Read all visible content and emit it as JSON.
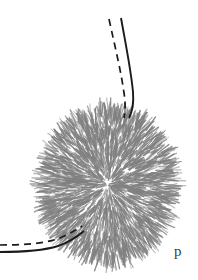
{
  "figure": {
    "type": "scientific-line-drawing",
    "background_color": "#ffffff",
    "ink_color": "#1a1a1a",
    "hair_color": "#808080",
    "panel_label": "p",
    "elements": {
      "spiny_ball": {
        "name": "spiny-ball",
        "center_x": 108,
        "center_y": 185,
        "radius_x": 61,
        "radius_y": 71,
        "bristle_count": 2600,
        "color": "#808080"
      },
      "upper_filament": {
        "name": "upper-filament",
        "style": "solid",
        "path": "M 121 18 C 126 46, 131 70, 133 92 C 134 104, 132 112, 129 118"
      },
      "upper_filament_dashed": {
        "name": "upper-filament-dashed",
        "style": "dashed",
        "path": "M 109 19 C 115 47, 121 71, 124 93 C 126 105, 125 112, 124 118"
      },
      "lower_filament": {
        "name": "lower-filament",
        "style": "solid",
        "path": "M 0 252 C 20 252, 42 251, 58 246 C 70 242, 78 236, 84 231"
      },
      "lower_filament_dashed": {
        "name": "lower-filament-dashed",
        "style": "dashed",
        "path": "M 0 245 C 20 245, 42 244, 57 239 C 68 235, 76 230, 82 226"
      }
    }
  }
}
